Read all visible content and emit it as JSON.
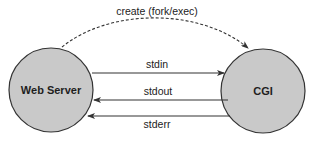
{
  "diagram": {
    "title": "",
    "colors": {
      "background": "#ffffff",
      "node_fill": "#c9c9c9",
      "node_stroke": "#333333",
      "edge": "#333333",
      "text": "#1e1e1e"
    },
    "nodes": [
      {
        "id": "web-server",
        "label": "Web Server",
        "cx": 51,
        "cy": 90,
        "r": 42
      },
      {
        "id": "cgi",
        "label": "CGI",
        "cx": 263,
        "cy": 91,
        "r": 42
      }
    ],
    "edges": [
      {
        "id": "create",
        "label": "create (fork/exec)",
        "from": "web-server",
        "to": "cgi",
        "style": "dashed",
        "shape": "arc"
      },
      {
        "id": "stdin",
        "label": "stdin",
        "from": "web-server",
        "to": "cgi",
        "style": "solid",
        "y": 73
      },
      {
        "id": "stdout",
        "label": "stdout",
        "from": "cgi",
        "to": "web-server",
        "style": "solid",
        "y": 100
      },
      {
        "id": "stderr",
        "label": "stderr",
        "from": "cgi",
        "to": "web-server",
        "style": "solid",
        "y": 116
      }
    ]
  }
}
